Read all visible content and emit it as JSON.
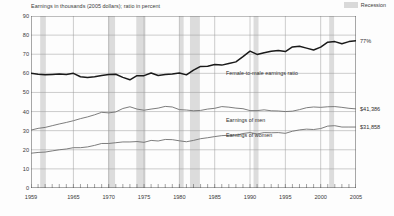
{
  "header": {
    "units_note": "Earnings in thousands (2005 dollars); ratio in percent",
    "legend_label": "Recession",
    "legend_swatch_color": "#d9d9d9"
  },
  "end_labels": {
    "ratio": "77%",
    "men": "$41,386",
    "women": "$31,858"
  },
  "series_labels": {
    "ratio": "Female-to-male earnings ratio",
    "men": "Earnings of men",
    "women": "Earnings of women"
  },
  "colors": {
    "ratio_line": "#1a1a1a",
    "men_line": "#6e6e6e",
    "women_line": "#6e6e6e",
    "recession_band": "#dcdcdc",
    "grid": "#9a9a9a",
    "axis": "#4a4a4a"
  },
  "chart_data": {
    "type": "line",
    "title": "",
    "subtitle": "",
    "xlabel": "",
    "ylabel": "",
    "units_note": "Earnings in thousands (2005 dollars); ratio in percent",
    "grid": true,
    "legend_position": "top-right",
    "xlim": [
      1959,
      2005
    ],
    "ylim": [
      0,
      90
    ],
    "yticks": [
      0,
      10,
      20,
      30,
      40,
      50,
      60,
      70,
      80,
      90
    ],
    "xticks": [
      1959,
      1965,
      1970,
      1975,
      1980,
      1985,
      1990,
      1995,
      2000,
      2005
    ],
    "x": [
      1959,
      1960,
      1961,
      1962,
      1963,
      1964,
      1965,
      1966,
      1967,
      1968,
      1969,
      1970,
      1971,
      1972,
      1973,
      1974,
      1975,
      1976,
      1977,
      1978,
      1979,
      1980,
      1981,
      1982,
      1983,
      1984,
      1985,
      1986,
      1987,
      1988,
      1989,
      1990,
      1991,
      1992,
      1993,
      1994,
      1995,
      1996,
      1997,
      1998,
      1999,
      2000,
      2001,
      2002,
      2003,
      2004,
      2005
    ],
    "series": [
      {
        "name": "Female-to-male earnings ratio",
        "unit": "percent",
        "color": "#1a1a1a",
        "end_value_label": "77%",
        "values": [
          60.0,
          59.5,
          59.2,
          59.4,
          59.6,
          59.4,
          60.0,
          58.2,
          57.8,
          58.2,
          58.9,
          59.4,
          59.5,
          57.9,
          56.6,
          58.8,
          58.8,
          60.2,
          58.9,
          59.4,
          59.7,
          60.2,
          59.2,
          61.7,
          63.6,
          63.7,
          64.6,
          64.3,
          65.2,
          66.0,
          68.7,
          71.6,
          69.9,
          70.8,
          71.5,
          72.0,
          71.4,
          73.8,
          74.2,
          73.2,
          72.2,
          73.7,
          76.3,
          76.6,
          75.5,
          76.6,
          77.0
        ]
      },
      {
        "name": "Earnings of men",
        "unit": "thousands of 2005 dollars",
        "color": "#6e6e6e",
        "end_value_label": "$41,386",
        "values": [
          30.3,
          31.2,
          31.7,
          32.6,
          33.5,
          34.3,
          35.2,
          36.3,
          37.2,
          38.3,
          39.6,
          39.3,
          39.8,
          41.6,
          42.5,
          41.3,
          40.7,
          41.3,
          41.8,
          42.7,
          42.4,
          41.0,
          40.8,
          40.4,
          40.6,
          41.3,
          41.7,
          42.6,
          42.3,
          41.8,
          41.5,
          40.5,
          40.5,
          40.9,
          40.4,
          40.3,
          40.0,
          40.2,
          41.0,
          42.0,
          42.4,
          42.2,
          42.5,
          42.6,
          42.2,
          41.7,
          41.4
        ]
      },
      {
        "name": "Earnings of women",
        "unit": "thousands of 2005 dollars",
        "color": "#6e6e6e",
        "end_value_label": "$31,858",
        "values": [
          18.2,
          18.6,
          18.8,
          19.4,
          20.0,
          20.4,
          21.1,
          21.1,
          21.5,
          22.3,
          23.3,
          23.3,
          23.7,
          24.1,
          24.1,
          24.3,
          23.9,
          24.9,
          24.6,
          25.4,
          25.3,
          24.7,
          24.2,
          24.9,
          25.8,
          26.3,
          26.9,
          27.4,
          27.6,
          27.6,
          28.5,
          29.0,
          28.3,
          29.0,
          28.9,
          29.0,
          28.6,
          29.7,
          30.4,
          30.8,
          30.6,
          31.1,
          32.4,
          32.6,
          31.9,
          31.9,
          31.9
        ]
      }
    ],
    "recession_bands": [
      {
        "start": 1960.3,
        "end": 1961.1
      },
      {
        "start": 1969.9,
        "end": 1970.9
      },
      {
        "start": 1973.9,
        "end": 1975.2
      },
      {
        "start": 1980.0,
        "end": 1980.6
      },
      {
        "start": 1981.5,
        "end": 1982.9
      },
      {
        "start": 1990.5,
        "end": 1991.2
      },
      {
        "start": 2001.2,
        "end": 2001.9
      }
    ],
    "annotations": [
      {
        "text": "Female-to-male earnings ratio",
        "series": "ratio"
      },
      {
        "text": "Earnings of men",
        "series": "men"
      },
      {
        "text": "Earnings of women",
        "series": "women"
      }
    ]
  }
}
